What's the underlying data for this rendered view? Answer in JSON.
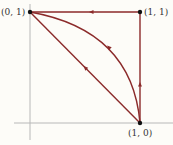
{
  "diagram": {
    "type": "path-diagram",
    "colors": {
      "path": "#8b2a2a",
      "axis": "#b8b8b8",
      "point": "#111111",
      "label": "#333333"
    },
    "points": [
      {
        "id": "p01",
        "label": "(0, 1)"
      },
      {
        "id": "p11",
        "label": "(1, 1)"
      },
      {
        "id": "p10",
        "label": "(1, 0)"
      }
    ],
    "paths": [
      {
        "name": "square-path",
        "route": [
          "(1, 0)",
          "(1, 1)",
          "(0, 1)"
        ],
        "segments": "straight"
      },
      {
        "name": "curved-path",
        "route": [
          "(1, 0)",
          "(0, 1)"
        ],
        "segments": "arc"
      },
      {
        "name": "diagonal-path",
        "route": [
          "(1, 0)",
          "(0, 1)"
        ],
        "segments": "straight"
      }
    ]
  }
}
